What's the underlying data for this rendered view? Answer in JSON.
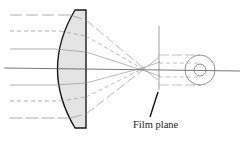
{
  "diagram": {
    "type": "optics-lens-ray-diagram",
    "labels": {
      "film_plane": "Film plane"
    },
    "colors": {
      "lens_fill": "#e4e4e4",
      "lens_stroke": "#1a1a1a",
      "ray_stroke": "#8a8a8a",
      "axis_stroke": "#444444"
    },
    "elements": {
      "lens": "plano-convex lens (curved side facing incoming light)",
      "optical_axis": "horizontal line through lens center",
      "incoming_rays": [
        {
          "y": 15,
          "style": "dashed"
        },
        {
          "y": 31,
          "style": "dashed"
        },
        {
          "y": 49,
          "style": "solid"
        },
        {
          "y": 85,
          "style": "solid"
        },
        {
          "y": 101,
          "style": "dashed"
        },
        {
          "y": 118,
          "style": "dashed"
        }
      ],
      "film_plane_marker": "vertical line behind focus",
      "blur_circle": "concentric circles (outer and inner) on axis"
    }
  }
}
